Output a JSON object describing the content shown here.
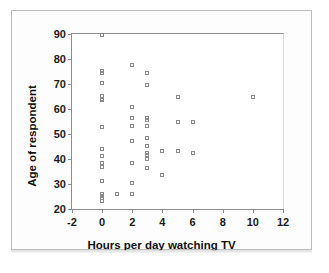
{
  "chart_data": {
    "type": "scatter",
    "title": "",
    "xlabel": "Hours per day watching TV",
    "ylabel": "Age of respondent",
    "xlim": [
      -2,
      12
    ],
    "ylim": [
      20,
      90
    ],
    "xticks": [
      -2,
      0,
      2,
      4,
      6,
      8,
      10,
      12
    ],
    "yticks": [
      20,
      30,
      40,
      50,
      60,
      70,
      80,
      90
    ],
    "xtick_labels": [
      "-2",
      "0",
      "2",
      "4",
      "6",
      "8",
      "10",
      "12"
    ],
    "ytick_labels": [
      "20",
      "30",
      "40",
      "50",
      "60",
      "70",
      "80",
      "90"
    ],
    "grid": false,
    "legend": false,
    "marker": "open-square",
    "marker_color": "#8a8a8a",
    "points": [
      {
        "x": 0,
        "y": 89.5
      },
      {
        "x": 0,
        "y": 75.2
      },
      {
        "x": 0,
        "y": 74.3
      },
      {
        "x": 0,
        "y": 70.3
      },
      {
        "x": 0,
        "y": 65.2
      },
      {
        "x": 0,
        "y": 64.2
      },
      {
        "x": 0,
        "y": 63.6
      },
      {
        "x": 0,
        "y": 53.0
      },
      {
        "x": 0,
        "y": 44.2
      },
      {
        "x": 0,
        "y": 41.2
      },
      {
        "x": 0,
        "y": 38.5
      },
      {
        "x": 0,
        "y": 36.7
      },
      {
        "x": 0,
        "y": 31.2
      },
      {
        "x": 0,
        "y": 26.0
      },
      {
        "x": 0,
        "y": 25.2
      },
      {
        "x": 0,
        "y": 24.3
      },
      {
        "x": 0,
        "y": 23.3
      },
      {
        "x": 1,
        "y": 25.9
      },
      {
        "x": 2,
        "y": 77.6
      },
      {
        "x": 2,
        "y": 60.7
      },
      {
        "x": 2,
        "y": 56.4
      },
      {
        "x": 2,
        "y": 53.2
      },
      {
        "x": 2,
        "y": 47.2
      },
      {
        "x": 2,
        "y": 38.4
      },
      {
        "x": 2,
        "y": 30.4
      },
      {
        "x": 2,
        "y": 26.2
      },
      {
        "x": 3,
        "y": 74.6
      },
      {
        "x": 3,
        "y": 69.5
      },
      {
        "x": 3,
        "y": 56.4
      },
      {
        "x": 3,
        "y": 55.6
      },
      {
        "x": 3,
        "y": 53.2
      },
      {
        "x": 3,
        "y": 48.6
      },
      {
        "x": 3,
        "y": 45.4
      },
      {
        "x": 3,
        "y": 42.6
      },
      {
        "x": 3,
        "y": 41.8
      },
      {
        "x": 3,
        "y": 40.2
      },
      {
        "x": 3,
        "y": 36.4
      },
      {
        "x": 4,
        "y": 43.2
      },
      {
        "x": 4,
        "y": 33.6
      },
      {
        "x": 5,
        "y": 64.7
      },
      {
        "x": 5,
        "y": 54.7
      },
      {
        "x": 5,
        "y": 43.3
      },
      {
        "x": 6,
        "y": 54.7
      },
      {
        "x": 6,
        "y": 42.5
      },
      {
        "x": 10,
        "y": 64.8
      }
    ]
  },
  "figure": {
    "y_axis_title": "Age of respondent",
    "x_axis_title": "Hours per day watching TV"
  }
}
